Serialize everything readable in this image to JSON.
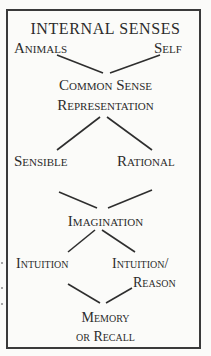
{
  "diagram": {
    "title": "INTERNAL SENSES",
    "nodes": {
      "animals": "Animals",
      "self": "Self",
      "common_sense_line1": "Common Sense",
      "common_sense_line2": "Representation",
      "sensible": "Sensible",
      "rational": "Rational",
      "imagination": "Imagination",
      "intuition": "Intuition",
      "intuition_reason_line1": "Intuition/",
      "intuition_reason_line2": "Reason",
      "memory_line1": "Memory",
      "memory_line2": "or Recall"
    },
    "edges": [
      [
        "animals",
        "common_sense"
      ],
      [
        "self",
        "common_sense"
      ],
      [
        "representation",
        "sensible"
      ],
      [
        "representation",
        "rational"
      ],
      [
        "sensible",
        "imagination"
      ],
      [
        "rational",
        "imagination"
      ],
      [
        "imagination",
        "intuition"
      ],
      [
        "imagination",
        "intuition_reason"
      ],
      [
        "intuition",
        "memory"
      ],
      [
        "intuition_reason",
        "memory"
      ]
    ]
  }
}
